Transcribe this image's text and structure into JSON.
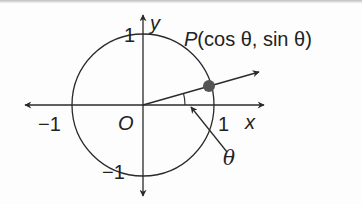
{
  "diagram": {
    "labels": {
      "y_axis": "y",
      "x_axis": "x",
      "origin": "O",
      "x_pos_one": "1",
      "x_neg_one": "−1",
      "y_pos_one": "1",
      "y_neg_one": "−1",
      "point": "P(cos θ, sin θ)",
      "point_name": "P",
      "point_coords": "(cos θ, sin θ)",
      "angle": "θ"
    },
    "colors": {
      "stroke": "#2a2a2a",
      "point_fill": "#555555",
      "background": "#fdfdfd"
    },
    "geometry": {
      "origin": [
        143,
        105
      ],
      "radius": 71,
      "point": [
        209,
        86
      ],
      "angle_deg": 16
    }
  }
}
